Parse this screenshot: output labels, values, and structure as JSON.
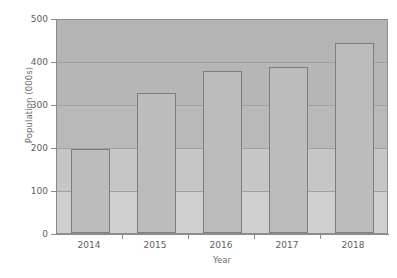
{
  "chart_data": {
    "type": "bar",
    "title": "",
    "xlabel": "Year",
    "ylabel": "Population (000s)",
    "categories": [
      "2014",
      "2015",
      "2016",
      "2017",
      "2018"
    ],
    "values": [
      197,
      328,
      380,
      390,
      445
    ],
    "series": [
      {
        "name": "Population",
        "values": [
          197,
          328,
          380,
          390,
          445
        ]
      }
    ],
    "ylim": [
      0,
      500
    ],
    "yticks": [
      0,
      100,
      200,
      300,
      400,
      500
    ],
    "ytick_labels": [
      "0",
      "100",
      "200",
      "300",
      "400",
      "500"
    ],
    "xtick_labels": [
      "2014",
      "2015",
      "2016",
      "2017",
      "2018"
    ],
    "grid": true,
    "grid_axis": "y",
    "legend": false,
    "legend_position": "none",
    "bar_color": "#bcbcbc",
    "bar_edge_color": "#7d7d7d",
    "plot_background": "#b8b8b8",
    "gridline_color": "#a0a0a0",
    "axis_color": "#8a8a8a",
    "text_color": "#5f5f5f"
  }
}
